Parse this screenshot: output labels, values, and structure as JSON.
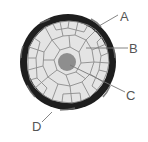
{
  "diagram": {
    "type": "cross-section",
    "colors": {
      "background": "#ffffff",
      "outer_ring": "#1e1e1e",
      "ring_highlight": "#6a6a6a",
      "inner_fill": "#e4e4e4",
      "cell_walls": "#8c8c8c",
      "core": "#8e8e8e",
      "leader_line": "#777777",
      "label": "#555555"
    },
    "labels": [
      {
        "id": "A",
        "text": "A",
        "target": "outer-ring"
      },
      {
        "id": "B",
        "text": "B",
        "target": "cellular-tissue"
      },
      {
        "id": "C",
        "text": "C",
        "target": "central-core"
      },
      {
        "id": "D",
        "text": "D",
        "target": "outer-ring-edge"
      }
    ]
  }
}
